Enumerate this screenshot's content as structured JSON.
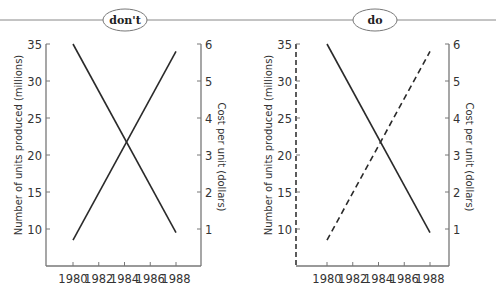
{
  "header": {
    "badges": [
      {
        "label": "don't"
      },
      {
        "label": "do"
      }
    ]
  },
  "chart_data": [
    {
      "type": "line",
      "title": "don't",
      "x": [
        1980,
        1988
      ],
      "xticks": [
        "1980",
        "1982",
        "1984",
        "1986",
        "1988"
      ],
      "xlabel": "",
      "ylabel": "Number of units produced (millions)",
      "ylabel_right": "Cost per unit (dollars)",
      "yticks_left": [
        "10",
        "15",
        "20",
        "25",
        "30",
        "35"
      ],
      "yticks_right": [
        "1",
        "2",
        "3",
        "4",
        "5",
        "6"
      ],
      "ylim_left": [
        5,
        35
      ],
      "ylim_right": [
        0,
        6
      ],
      "left_axis_style": "solid",
      "series": [
        {
          "name": "Number of units produced (millions)",
          "axis": "left",
          "style": "solid",
          "x": [
            1980,
            1988
          ],
          "values": [
            35,
            9.5
          ]
        },
        {
          "name": "Cost per unit (dollars)",
          "axis": "right",
          "style": "solid",
          "x": [
            1980,
            1988
          ],
          "values": [
            0.7,
            5.8
          ]
        }
      ],
      "grid": false
    },
    {
      "type": "line",
      "title": "do",
      "x": [
        1980,
        1988
      ],
      "xticks": [
        "1980",
        "1982",
        "1984",
        "1986",
        "1988"
      ],
      "xlabel": "",
      "ylabel": "Number of units produced (millions)",
      "ylabel_right": "Cost per unit (dollars)",
      "yticks_left": [
        "10",
        "15",
        "20",
        "25",
        "30",
        "35"
      ],
      "yticks_right": [
        "1",
        "2",
        "3",
        "4",
        "5",
        "6"
      ],
      "ylim_left": [
        5,
        35
      ],
      "ylim_right": [
        0,
        6
      ],
      "left_axis_style": "dashed",
      "series": [
        {
          "name": "Number of units produced (millions)",
          "axis": "left",
          "style": "solid",
          "x": [
            1980,
            1988
          ],
          "values": [
            35,
            9.5
          ]
        },
        {
          "name": "Cost per unit (dollars)",
          "axis": "right",
          "style": "dashed",
          "x": [
            1980,
            1988
          ],
          "values": [
            0.7,
            5.8
          ]
        }
      ],
      "grid": false
    }
  ]
}
